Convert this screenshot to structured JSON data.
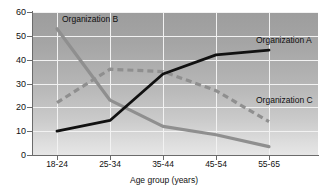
{
  "chart_data": {
    "type": "line",
    "title": "",
    "xlabel": "Age group (years)",
    "ylabel": "",
    "categories": [
      "18-24",
      "25-34",
      "35-44",
      "45-54",
      "55-65"
    ],
    "yticks": [
      0,
      10,
      20,
      30,
      40,
      50,
      60
    ],
    "ylim": [
      0,
      60
    ],
    "grid": true,
    "legend_position": "inline-annotations",
    "series": [
      {
        "name": "Organization A",
        "style": "solid",
        "color": "#111111",
        "values": [
          10,
          14.5,
          34,
          42,
          44
        ]
      },
      {
        "name": "Organization B",
        "style": "solid",
        "color": "#8f8f8f",
        "values": [
          53,
          23,
          12,
          8.5,
          3.5
        ]
      },
      {
        "name": "Organization C",
        "style": "dashed",
        "color": "#8f8f8f",
        "values": [
          22,
          36,
          35,
          27,
          14
        ]
      }
    ],
    "annotations": [
      {
        "text": "Organization A",
        "series": "Organization A"
      },
      {
        "text": "Organization B",
        "series": "Organization B"
      },
      {
        "text": "Organization C",
        "series": "Organization C"
      }
    ]
  },
  "axis": {
    "x_title": "Age group (years)",
    "x_tick_labels": [
      "18-24",
      "25-34",
      "35-44",
      "45-54",
      "55-65"
    ],
    "y_tick_labels": [
      "60",
      "50",
      "40",
      "30",
      "20",
      "10",
      "0"
    ]
  },
  "colors": {
    "series_a": "#111111",
    "series_b": "#8f8f8f",
    "series_c": "#8f8f8f",
    "gridline": "#f2f2f2",
    "axis": "#6b6b6b",
    "plot_bg_top": "#9d9d9d",
    "plot_bg_bottom": "#e6e6e6",
    "page_bg": "#ffffff"
  }
}
